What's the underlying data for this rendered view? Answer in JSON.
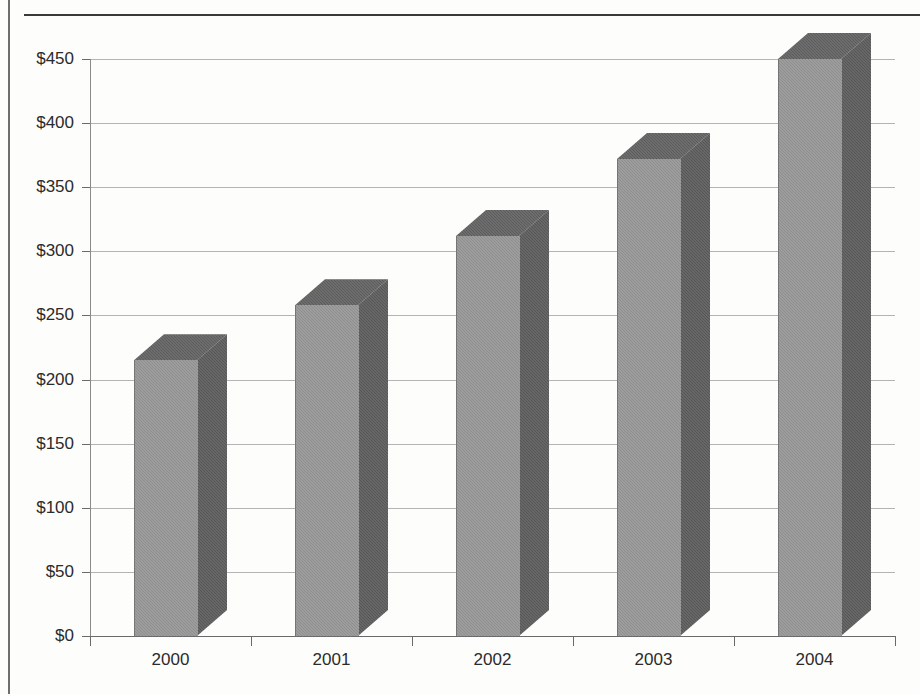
{
  "chart_data": {
    "type": "bar",
    "title": "",
    "subtitle": "",
    "xlabel": "",
    "ylabel": "",
    "categories": [
      "2000",
      "2001",
      "2002",
      "2003",
      "2004"
    ],
    "values": [
      215,
      258,
      312,
      372,
      450
    ],
    "value_prefix": "$",
    "ylim": [
      0,
      450
    ],
    "ytick_values": [
      0,
      50,
      100,
      150,
      200,
      250,
      300,
      350,
      400,
      450
    ],
    "ytick_labels": [
      "$0",
      "$50",
      "$100",
      "$150",
      "$200",
      "$250",
      "$300",
      "$350",
      "$400",
      "$450"
    ],
    "grid": true,
    "legend": null,
    "style": {
      "three_d": true,
      "bar_front_color": "#8e8e8e",
      "bar_side_color": "#565656",
      "bar_top_color": "#5c5c5c",
      "gridline_color": "#b4b4b4",
      "axis_color": "#6a6a6a",
      "text_color": "#2b2b2b",
      "background_color": "#fdfdfc"
    }
  },
  "page": {
    "left_rule_color": "#6e6e6e",
    "top_rule_color": "#3a3a3a"
  }
}
